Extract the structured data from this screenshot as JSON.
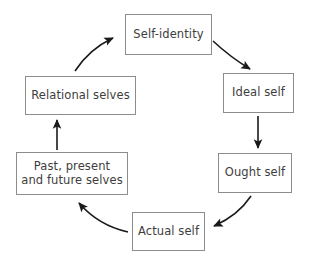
{
  "diagram": {
    "type": "cycle",
    "background_color": "#ffffff",
    "box_border_color": "#8c8c8c",
    "text_color": "#3d3d3d",
    "arrow_color": "#1a1a1a",
    "nodes": [
      {
        "id": "self-identity",
        "label": "Self-identity",
        "position": "top"
      },
      {
        "id": "ideal-self",
        "label": "Ideal self",
        "position": "upper-right"
      },
      {
        "id": "ought-self",
        "label": "Ought self",
        "position": "lower-right"
      },
      {
        "id": "actual-self",
        "label": "Actual self",
        "position": "bottom"
      },
      {
        "id": "past-present-future-selves",
        "label": "Past, present\nand future selves",
        "position": "lower-left"
      },
      {
        "id": "relational-selves",
        "label": "Relational selves",
        "position": "upper-left"
      }
    ],
    "edges": [
      {
        "id": "self-identity-to-ideal-self",
        "from": "self-identity",
        "to": "ideal-self",
        "style": "curved",
        "direction": "clockwise"
      },
      {
        "id": "ideal-self-to-ought-self",
        "from": "ideal-self",
        "to": "ought-self",
        "style": "straight",
        "direction": "down"
      },
      {
        "id": "ought-self-to-actual-self",
        "from": "ought-self",
        "to": "actual-self",
        "style": "curved",
        "direction": "clockwise"
      },
      {
        "id": "actual-self-to-past-present-future-selves",
        "from": "actual-self",
        "to": "past-present-future-selves",
        "style": "curved",
        "direction": "clockwise"
      },
      {
        "id": "past-present-future-selves-to-relational-selves",
        "from": "past-present-future-selves",
        "to": "relational-selves",
        "style": "straight",
        "direction": "up"
      },
      {
        "id": "relational-selves-to-self-identity",
        "from": "relational-selves",
        "to": "self-identity",
        "style": "curved",
        "direction": "clockwise"
      }
    ]
  }
}
